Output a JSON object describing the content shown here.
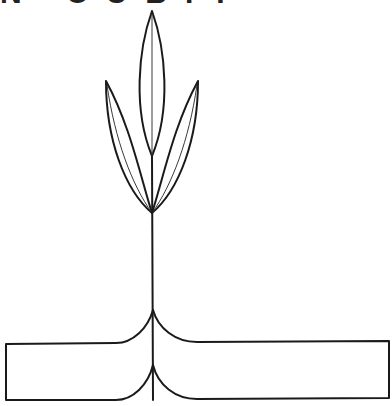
{
  "figure": {
    "top_text_fragment": "N CUBIT",
    "stroke_color": "#1a1a1a",
    "background": "#ffffff"
  }
}
